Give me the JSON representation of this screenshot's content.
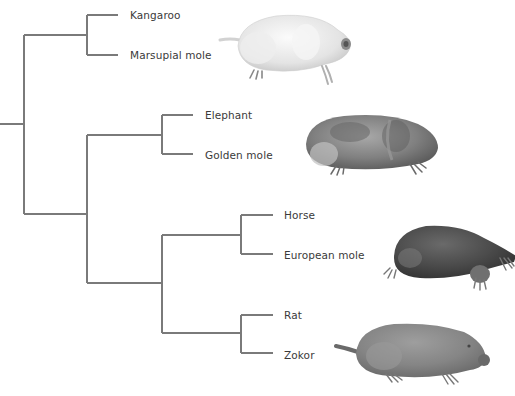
{
  "diagram": {
    "type": "phylogenetic-tree",
    "line_color": "#7a7a7a",
    "text_color": "#3a3a3a",
    "leaves": [
      {
        "id": "kangaroo",
        "label": "Kangaroo"
      },
      {
        "id": "marsupial-mole",
        "label": "Marsupial mole"
      },
      {
        "id": "elephant",
        "label": "Elephant"
      },
      {
        "id": "golden-mole",
        "label": "Golden mole"
      },
      {
        "id": "horse",
        "label": "Horse"
      },
      {
        "id": "european-mole",
        "label": "European mole"
      },
      {
        "id": "rat",
        "label": "Rat"
      },
      {
        "id": "zokor",
        "label": "Zokor"
      }
    ],
    "clades": [
      {
        "members": [
          "Kangaroo",
          "Marsupial mole"
        ]
      },
      {
        "members": [
          "Elephant",
          "Golden mole"
        ]
      },
      {
        "members": [
          "Horse",
          "European mole"
        ]
      },
      {
        "members": [
          "Rat",
          "Zokor"
        ]
      },
      {
        "members": [
          "Horse",
          "European mole",
          "Rat",
          "Zokor"
        ]
      },
      {
        "members": [
          "Elephant",
          "Golden mole",
          "Horse",
          "European mole",
          "Rat",
          "Zokor"
        ]
      }
    ],
    "illustrations": [
      {
        "name": "marsupial-mole-illustration",
        "depicts": "Marsupial mole",
        "color": "#e8e8e8"
      },
      {
        "name": "golden-mole-illustration",
        "depicts": "Golden mole",
        "color": "#8a8a8a"
      },
      {
        "name": "european-mole-illustration",
        "depicts": "European mole",
        "color": "#4a4a4a"
      },
      {
        "name": "zokor-illustration",
        "depicts": "Zokor",
        "color": "#8c8c8c"
      }
    ]
  }
}
